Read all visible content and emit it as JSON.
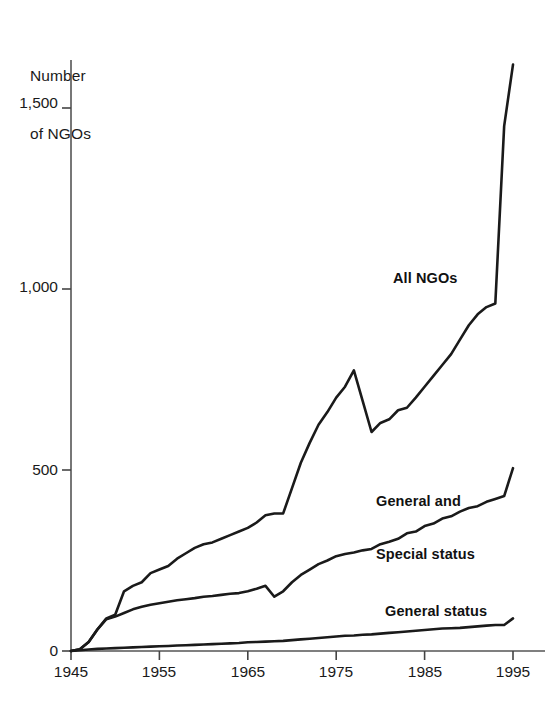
{
  "chart_data": {
    "type": "line",
    "title": "",
    "subtitle": "",
    "xlabel": "",
    "ylabel": "Number\nof NGOs",
    "ylabel_line1": "Number",
    "ylabel_line2": "of NGOs",
    "xlim": [
      1945,
      1996
    ],
    "ylim": [
      0,
      1700
    ],
    "grid": false,
    "legend_position": "inline-annotations",
    "x_ticks": [
      1945,
      1955,
      1965,
      1975,
      1985,
      1995
    ],
    "x_tick_labels": [
      "1945",
      "1955",
      "1965",
      "1975",
      "1985",
      "1995"
    ],
    "y_ticks": [
      0,
      500,
      1000,
      1500
    ],
    "y_tick_labels": [
      "0",
      "500",
      "1,000",
      "1,500"
    ],
    "line_color": "#1a1a1a",
    "axis_color": "#444444",
    "series": [
      {
        "name": "All NGOs",
        "label": "All NGOs",
        "label_x": 1978,
        "label_y": 1040,
        "x": [
          1945,
          1946,
          1947,
          1948,
          1949,
          1950,
          1951,
          1952,
          1953,
          1954,
          1955,
          1956,
          1957,
          1958,
          1959,
          1960,
          1961,
          1962,
          1963,
          1964,
          1965,
          1966,
          1967,
          1968,
          1969,
          1970,
          1971,
          1972,
          1973,
          1974,
          1975,
          1976,
          1977,
          1978,
          1979,
          1980,
          1981,
          1982,
          1983,
          1984,
          1985,
          1986,
          1987,
          1988,
          1989,
          1990,
          1991,
          1992,
          1993,
          1994,
          1995
        ],
        "values": [
          0,
          5,
          25,
          60,
          90,
          100,
          165,
          180,
          190,
          215,
          225,
          235,
          255,
          270,
          285,
          295,
          300,
          310,
          320,
          330,
          340,
          355,
          375,
          380,
          380,
          450,
          520,
          575,
          625,
          660,
          700,
          730,
          775,
          690,
          605,
          630,
          640,
          665,
          672,
          700,
          730,
          760,
          790,
          820,
          860,
          900,
          930,
          950,
          960,
          1450,
          1620
        ]
      },
      {
        "name": "General and Special status",
        "label": "General and\nSpecial status",
        "label_line1": "General and",
        "label_line2": "Special status",
        "label_x": 1978,
        "label_y": 530,
        "x": [
          1945,
          1946,
          1947,
          1948,
          1949,
          1950,
          1951,
          1952,
          1953,
          1954,
          1955,
          1956,
          1957,
          1958,
          1959,
          1960,
          1961,
          1962,
          1963,
          1964,
          1965,
          1966,
          1967,
          1968,
          1969,
          1970,
          1971,
          1972,
          1973,
          1974,
          1975,
          1976,
          1977,
          1978,
          1979,
          1980,
          1981,
          1982,
          1983,
          1984,
          1985,
          1986,
          1987,
          1988,
          1989,
          1990,
          1991,
          1992,
          1993,
          1994,
          1995
        ],
        "values": [
          0,
          5,
          25,
          60,
          88,
          95,
          105,
          115,
          122,
          128,
          132,
          136,
          140,
          143,
          146,
          150,
          152,
          155,
          158,
          160,
          165,
          172,
          180,
          150,
          165,
          190,
          210,
          225,
          240,
          250,
          262,
          268,
          272,
          278,
          282,
          295,
          302,
          310,
          325,
          330,
          345,
          352,
          366,
          372,
          385,
          395,
          400,
          412,
          420,
          428,
          505
        ]
      },
      {
        "name": "General status",
        "label": "General status",
        "label_x": 1979,
        "label_y": 130,
        "x": [
          1945,
          1946,
          1947,
          1948,
          1949,
          1950,
          1951,
          1952,
          1953,
          1954,
          1955,
          1956,
          1957,
          1958,
          1959,
          1960,
          1961,
          1962,
          1963,
          1964,
          1965,
          1966,
          1967,
          1968,
          1969,
          1970,
          1971,
          1972,
          1973,
          1974,
          1975,
          1976,
          1977,
          1978,
          1979,
          1980,
          1981,
          1982,
          1983,
          1984,
          1985,
          1986,
          1987,
          1988,
          1989,
          1990,
          1991,
          1992,
          1993,
          1994,
          1995
        ],
        "values": [
          0,
          2,
          4,
          6,
          7,
          8,
          9,
          10,
          11,
          12,
          13,
          14,
          15,
          16,
          17,
          18,
          19,
          20,
          21,
          22,
          24,
          25,
          26,
          27,
          28,
          30,
          32,
          34,
          36,
          38,
          40,
          42,
          43,
          45,
          46,
          48,
          50,
          52,
          54,
          56,
          58,
          60,
          62,
          63,
          64,
          66,
          68,
          70,
          72,
          72,
          90
        ]
      }
    ]
  }
}
